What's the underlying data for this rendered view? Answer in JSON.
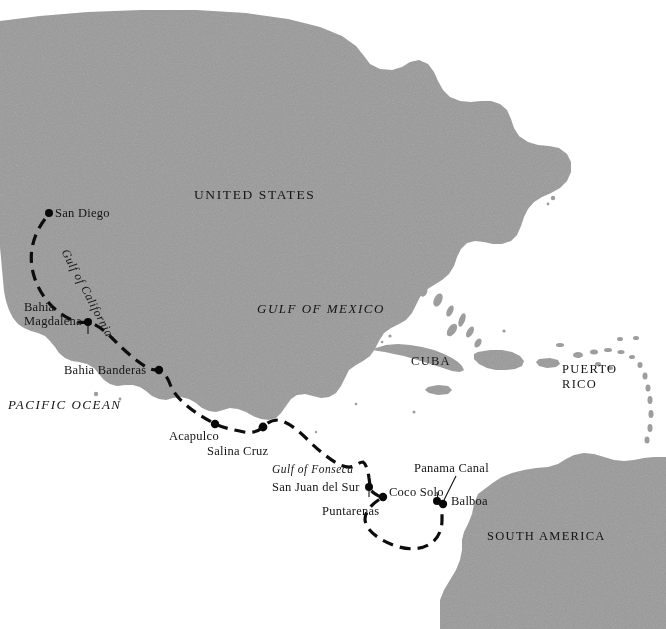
{
  "map": {
    "title": "Voyage route map of the Americas",
    "colors": {
      "land": "#9a9a9a",
      "ocean": "#ffffff",
      "route": "#0d0d0d",
      "text": "#141414",
      "dot": "#080808"
    },
    "region_labels": [
      {
        "id": "united-states",
        "text": "UNITED STATES",
        "style": "roman-caps",
        "x": 194,
        "y": 194
      },
      {
        "id": "gulf-of-mexico",
        "text": "GULF OF MEXICO",
        "style": "italic-caps",
        "x": 257,
        "y": 309
      },
      {
        "id": "pacific-ocean",
        "text": "PACIFIC OCEAN",
        "style": "italic-caps",
        "x": 8,
        "y": 405
      },
      {
        "id": "cuba",
        "text": "CUBA",
        "style": "roman-caps",
        "x": 411,
        "y": 361
      },
      {
        "id": "puerto-rico-line1",
        "text": "PUERTO",
        "style": "roman-caps",
        "x": 562,
        "y": 369
      },
      {
        "id": "puerto-rico-line2",
        "text": "RICO",
        "style": "roman-caps",
        "x": 562,
        "y": 384
      },
      {
        "id": "south-america",
        "text": "SOUTH AMERICA",
        "style": "roman-caps",
        "x": 487,
        "y": 536
      },
      {
        "id": "gulf-of-california",
        "text": "Gulf of California",
        "style": "italic-rotated",
        "x": 73,
        "y": 251
      },
      {
        "id": "gulf-of-fonseca",
        "text": "Gulf of Fonseca",
        "style": "italic",
        "x": 272,
        "y": 470
      }
    ],
    "ports": [
      {
        "id": "san-diego",
        "name": "San Diego",
        "dot_x": 49,
        "dot_y": 213,
        "label_x": 55,
        "label_y": 206,
        "align": "left",
        "lines": [
          "San Diego"
        ]
      },
      {
        "id": "bahia-magdalena",
        "name": "Bahia Magdalena",
        "dot_x": 88,
        "dot_y": 322,
        "label_x": 24,
        "label_y": 306,
        "align": "left",
        "lines": [
          "Bahia",
          "Magdalena"
        ]
      },
      {
        "id": "bahia-banderas",
        "name": "Bahia Banderas",
        "dot_x": 159,
        "dot_y": 370,
        "label_x": 64,
        "label_y": 368,
        "align": "left",
        "lines": [
          "Bahia Banderas"
        ]
      },
      {
        "id": "acapulco",
        "name": "Acapulco",
        "dot_x": 215,
        "dot_y": 424,
        "label_x": 169,
        "label_y": 431,
        "align": "left",
        "lines": [
          "Acapulco"
        ]
      },
      {
        "id": "salina-cruz",
        "name": "Salina Cruz",
        "dot_x": 263,
        "dot_y": 427,
        "label_x": 207,
        "label_y": 446,
        "align": "left",
        "lines": [
          "Salina Cruz"
        ]
      },
      {
        "id": "san-juan-del-sur",
        "name": "San Juan del Sur",
        "dot_x": 369,
        "dot_y": 487,
        "label_x": 272,
        "label_y": 485,
        "align": "left",
        "lines": [
          "San Juan del Sur"
        ]
      },
      {
        "id": "puntarenas",
        "name": "Puntarenas",
        "dot_x": 383,
        "dot_y": 497,
        "label_x": 322,
        "label_y": 508,
        "align": "left",
        "lines": [
          "Puntarenas"
        ]
      },
      {
        "id": "coco-solo",
        "name": "Coco Solo",
        "dot_x": 438,
        "dot_y": 501,
        "label_x": 389,
        "label_y": 489,
        "align": "left",
        "lines": [
          "Coco Solo"
        ]
      },
      {
        "id": "balboa",
        "name": "Balboa",
        "dot_x": 443,
        "dot_y": 504,
        "label_x": 450,
        "label_y": 498,
        "align": "left",
        "lines": [
          "Balboa"
        ]
      }
    ],
    "annotations": [
      {
        "id": "panama-canal",
        "text": "Panama Canal",
        "label_x": 414,
        "label_y": 466,
        "leader": {
          "x1": 456,
          "y1": 478,
          "x2": 444,
          "y2": 500
        }
      }
    ],
    "route": {
      "name": "voyage-route",
      "style": "dashed",
      "waypoint_order": [
        "San Diego",
        "Bahia Magdalena",
        "Bahia Banderas",
        "Acapulco",
        "Salina Cruz",
        "Gulf of Fonseca",
        "San Juan del Sur",
        "Puntarenas",
        "Balboa",
        "Coco Solo"
      ]
    }
  }
}
